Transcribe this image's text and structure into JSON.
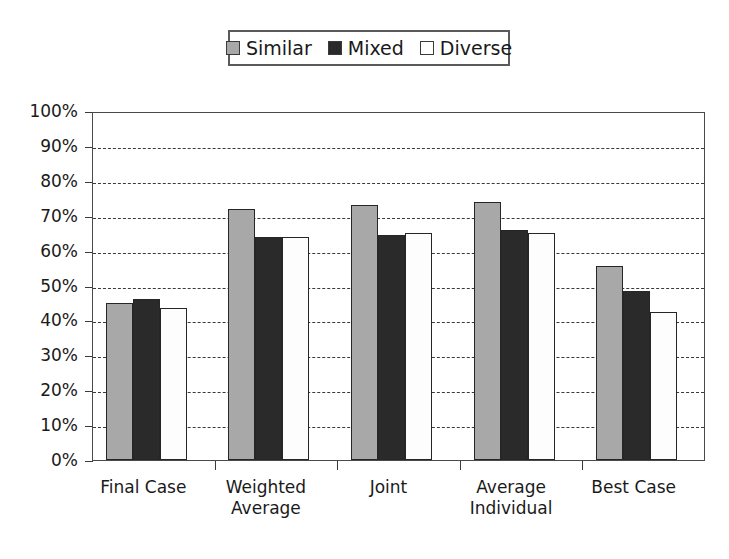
{
  "chart_data": {
    "type": "bar",
    "title": "",
    "subtitle": "",
    "xlabel": "",
    "ylabel": "",
    "ylim": [
      0,
      100
    ],
    "yunit": "%",
    "grid": true,
    "legend_position": "top-center",
    "categories": [
      "Final Case",
      "Weighted\nAverage",
      "Joint",
      "Average\nIndividual",
      "Best Case"
    ],
    "category_labels_flat": [
      "Final Case",
      "Weighted Average",
      "Joint",
      "Average Individual",
      "Best Case"
    ],
    "ytick_labels": [
      "100%",
      "90%",
      "80%",
      "70%",
      "60%",
      "50%",
      "40%",
      "30%",
      "20%",
      "10%",
      "0%"
    ],
    "ytick_values": [
      100,
      90,
      80,
      70,
      60,
      50,
      40,
      30,
      20,
      10,
      0
    ],
    "series": [
      {
        "name": "Similar",
        "color": "#a8a8a8",
        "values": [
          45.0,
          72.0,
          73.0,
          74.0,
          55.5
        ]
      },
      {
        "name": "Mixed",
        "color": "#2a2a2a",
        "values": [
          46.0,
          64.0,
          64.5,
          66.0,
          48.5
        ]
      },
      {
        "name": "Diverse",
        "color": "#ffffff",
        "values": [
          43.5,
          64.0,
          65.0,
          65.0,
          42.5
        ]
      }
    ]
  },
  "legend": {
    "entries": [
      {
        "label": "Similar",
        "color": "#a8a8a8"
      },
      {
        "label": "Mixed",
        "color": "#2a2a2a"
      },
      {
        "label": "Diverse",
        "color": "#ffffff"
      }
    ]
  }
}
